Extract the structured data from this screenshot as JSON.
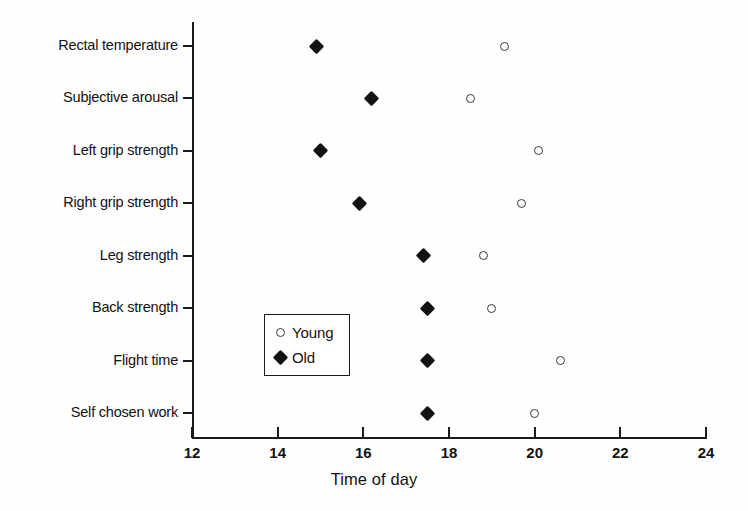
{
  "chart_data": {
    "type": "scatter",
    "title": "",
    "xlabel": "Time of day",
    "ylabel": "",
    "xlim": [
      12,
      24
    ],
    "xticks": [
      "12",
      "14",
      "16",
      "18",
      "20",
      "22",
      "24"
    ],
    "grid": false,
    "legend_position": "inside-lower-left",
    "categories": [
      "Rectal temperature",
      "Subjective arousal",
      "Left grip strength",
      "Right grip strength",
      "Leg strength",
      "Back strength",
      "Flight time",
      "Self chosen work"
    ],
    "series": [
      {
        "name": "Young",
        "marker": "open-circle",
        "values": [
          19.3,
          18.5,
          20.1,
          19.7,
          18.8,
          19.0,
          20.6,
          20.0
        ]
      },
      {
        "name": "Old",
        "marker": "filled-diamond",
        "values": [
          14.9,
          16.2,
          15.0,
          15.9,
          17.4,
          17.5,
          17.5,
          17.5
        ]
      }
    ]
  },
  "legend": {
    "entries": [
      {
        "label": "Young",
        "marker": "open-circle"
      },
      {
        "label": "Old",
        "marker": "filled-diamond"
      }
    ]
  },
  "colors": {
    "axis": "#1a1a1a",
    "text": "#121212",
    "marker_old": "#121212",
    "marker_young_stroke": "#3a3a3a",
    "background": "#fefefe"
  }
}
